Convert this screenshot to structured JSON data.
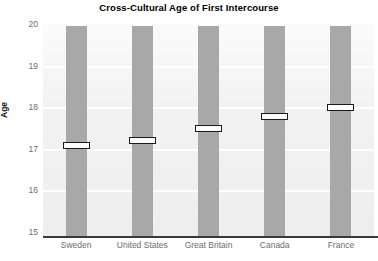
{
  "chart_data": {
    "type": "bar",
    "title": "Cross-Cultural Age of First Intercourse",
    "xlabel": "",
    "ylabel": "Age",
    "categories": [
      "Sweden",
      "United States",
      "Great Britain",
      "Canada",
      "France"
    ],
    "values": [
      17.1,
      17.2,
      17.5,
      17.8,
      18.0
    ],
    "series": [
      {
        "name": "Age of First Intercourse",
        "values": [
          17.1,
          17.2,
          17.5,
          17.8,
          18.0
        ]
      }
    ],
    "ylim": [
      15,
      20
    ],
    "yticks": [
      15,
      16,
      17,
      18,
      19,
      20
    ],
    "ytick_labels": [
      "15",
      "16",
      "17",
      "18",
      "19",
      "20"
    ],
    "grid": true,
    "legend": false,
    "legend_position": "none",
    "bar_top_value": 20,
    "marker_style": "white-band-outlined",
    "colors": {
      "bar": "#a8a8a8",
      "marker_fill": "#fdfdfd",
      "marker_border": "#1a1a1a",
      "plot_background": "#f2f2f2",
      "gridline": "#ffffff",
      "axis": "#3a3a3a",
      "tick_label": "#6d6d6d",
      "title": "#000000"
    }
  }
}
